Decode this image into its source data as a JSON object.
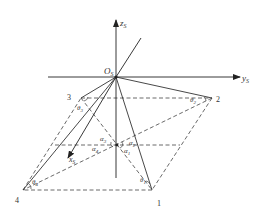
{
  "figure": {
    "axes": {
      "z_label": "z",
      "z_sub": "S",
      "y_label": "y",
      "y_sub": "S",
      "x_label": "x",
      "x_sub": "S",
      "origin_label": "O",
      "origin_sub": "S"
    },
    "points": [
      {
        "id": "1",
        "label": "1"
      },
      {
        "id": "2",
        "label": "2"
      },
      {
        "id": "3",
        "label": "3"
      },
      {
        "id": "4",
        "label": "4"
      }
    ],
    "angles": {
      "theta1": {
        "sym": "θ",
        "sub": "1"
      },
      "theta2": {
        "sym": "θ",
        "sub": "2"
      },
      "theta3": {
        "sym": "θ",
        "sub": "3"
      },
      "theta4": {
        "sym": "θ",
        "sub": "4"
      },
      "alpha1": {
        "sym": "α",
        "sub": "1"
      },
      "alpha2": {
        "sym": "α",
        "sub": "2"
      },
      "alpha3": {
        "sym": "α",
        "sub": "3"
      },
      "alpha4": {
        "sym": "α",
        "sub": "4"
      }
    },
    "colors": {
      "line": "#333333",
      "dash": "#444444"
    }
  }
}
